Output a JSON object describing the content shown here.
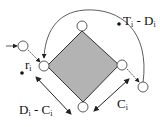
{
  "diagram": {
    "labels": {
      "release": {
        "main": "r",
        "sub": "i"
      },
      "deadline_gap": {
        "a": "T",
        "a_sub": "i",
        "sep": " - ",
        "b": "D",
        "b_sub": "i"
      },
      "slack": {
        "a": "D",
        "a_sub": "i",
        "sep": " - ",
        "b": "C",
        "b_sub": "i"
      },
      "exec": {
        "main": "C",
        "sub": "i"
      }
    },
    "colors": {
      "fill": "#b3b3b3",
      "stroke": "#333333"
    }
  }
}
